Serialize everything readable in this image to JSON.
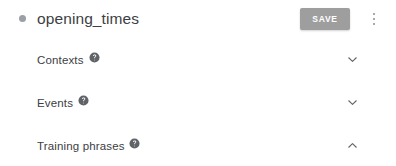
{
  "header": {
    "status_dot": "status-dot",
    "title": "opening_times",
    "save_label": "SAVE",
    "overflow_menu": "more-options",
    "save_color": "#9e9e9e",
    "dot_color": "#9aa0a6"
  },
  "sections": [
    {
      "label": "Contexts",
      "help_icon": "help-icon",
      "expanded": false,
      "chevron": "chevron-down-icon"
    },
    {
      "label": "Events",
      "help_icon": "help-icon",
      "expanded": false,
      "chevron": "chevron-down-icon"
    },
    {
      "label": "Training phrases",
      "help_icon": "help-icon",
      "expanded": true,
      "chevron": "chevron-up-icon"
    }
  ],
  "colors": {
    "text": "#3c4043",
    "divider": "#ececec",
    "icon": "#5f6368",
    "background": "#ffffff"
  }
}
